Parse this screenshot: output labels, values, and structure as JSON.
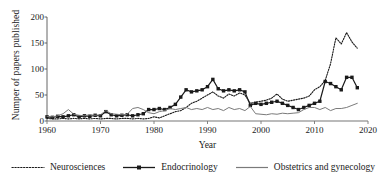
{
  "chart_data": {
    "type": "line",
    "title": "",
    "xlabel": "Year",
    "ylabel": "Numper of papers published",
    "xlim": [
      1960,
      2020
    ],
    "ylim": [
      0,
      200
    ],
    "yticks": [
      0,
      50,
      100,
      150,
      200
    ],
    "xticks": [
      1960,
      1970,
      1980,
      1990,
      2000,
      2010,
      2020
    ],
    "grid": false,
    "legend_position": "below",
    "x": [
      1960,
      1961,
      1962,
      1963,
      1964,
      1965,
      1966,
      1967,
      1968,
      1969,
      1970,
      1971,
      1972,
      1973,
      1974,
      1975,
      1976,
      1977,
      1978,
      1979,
      1980,
      1981,
      1982,
      1983,
      1984,
      1985,
      1986,
      1987,
      1988,
      1989,
      1990,
      1991,
      1992,
      1993,
      1994,
      1995,
      1996,
      1997,
      1998,
      1999,
      2000,
      2001,
      2002,
      2003,
      2004,
      2005,
      2006,
      2007,
      2008,
      2009,
      2010,
      2011,
      2012,
      2013,
      2014,
      2015,
      2016,
      2017,
      2018
    ],
    "series": [
      {
        "name": "Neurosciences",
        "style": "dotted",
        "color": "#1a1a1a",
        "marker": "none",
        "values": [
          5,
          4,
          4,
          5,
          4,
          5,
          4,
          5,
          4,
          5,
          4,
          5,
          5,
          4,
          5,
          5,
          4,
          5,
          4,
          5,
          8,
          6,
          10,
          14,
          18,
          20,
          26,
          34,
          38,
          44,
          50,
          56,
          48,
          44,
          52,
          48,
          54,
          50,
          34,
          36,
          38,
          40,
          44,
          52,
          42,
          38,
          40,
          42,
          44,
          48,
          60,
          66,
          78,
          110,
          160,
          148,
          170,
          152,
          140
        ]
      },
      {
        "name": "Endocrinology",
        "style": "solid-marker",
        "color": "#1a1a1a",
        "marker": "square",
        "values": [
          8,
          7,
          9,
          8,
          10,
          12,
          8,
          10,
          9,
          11,
          10,
          18,
          12,
          10,
          11,
          12,
          10,
          12,
          14,
          22,
          22,
          24,
          22,
          26,
          32,
          46,
          60,
          56,
          58,
          60,
          66,
          80,
          62,
          58,
          60,
          58,
          60,
          56,
          30,
          34,
          32,
          34,
          36,
          38,
          34,
          30,
          26,
          22,
          26,
          30,
          34,
          38,
          76,
          72,
          66,
          60,
          84,
          84,
          64
        ]
      },
      {
        "name": "Obstetrics and gynecology",
        "style": "solid",
        "color": "#7a7a7a",
        "marker": "none",
        "values": [
          9,
          8,
          10,
          14,
          22,
          13,
          11,
          10,
          12,
          11,
          12,
          20,
          14,
          13,
          12,
          13,
          24,
          26,
          22,
          16,
          14,
          18,
          20,
          24,
          22,
          24,
          26,
          22,
          24,
          22,
          26,
          22,
          24,
          20,
          26,
          22,
          24,
          20,
          28,
          14,
          13,
          12,
          14,
          13,
          15,
          14,
          15,
          16,
          22,
          26,
          26,
          22,
          26,
          20,
          24,
          24,
          26,
          30,
          34
        ]
      }
    ]
  },
  "axis": {
    "y_tick_labels": [
      "200",
      "150",
      "100",
      "50",
      "0"
    ],
    "x_tick_labels": [
      "1960",
      "1970",
      "1980",
      "1990",
      "2000",
      "2010",
      "2020"
    ],
    "y_title": "Numper of papers published",
    "x_title": "Year"
  },
  "legend": {
    "items": [
      {
        "label": "Neurosciences",
        "swatch": "dotted-line-swatch"
      },
      {
        "label": "Endocrinology",
        "swatch": "line-square-marker-swatch"
      },
      {
        "label": "Obstetrics and gynecology",
        "swatch": "solid-gray-line-swatch"
      }
    ]
  }
}
